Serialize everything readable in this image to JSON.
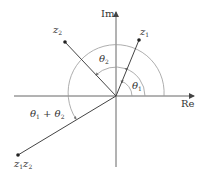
{
  "diagram": {
    "axes": {
      "real_label": "Re",
      "imag_label": "Im"
    },
    "points": {
      "z1": {
        "label_main": "z",
        "label_sub": "1"
      },
      "z2": {
        "label_main": "z",
        "label_sub": "2"
      },
      "z1z2": {
        "label_a": "z",
        "sub_a": "1",
        "label_b": "z",
        "sub_b": "2"
      }
    },
    "angles": {
      "theta1": {
        "main": "θ",
        "sub": "1"
      },
      "theta2": {
        "main": "θ",
        "sub": "2"
      },
      "sum": {
        "main1": "θ",
        "sub1": "1",
        "plus": " + ",
        "main2": "θ",
        "sub2": "2"
      }
    },
    "colors": {
      "axis": "#555555",
      "vector": "#444444",
      "arc": "#999999",
      "text": "#333333"
    }
  }
}
